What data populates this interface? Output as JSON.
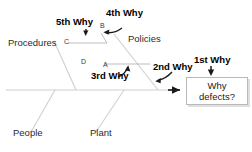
{
  "diagram": {
    "type": "fishbone-ishikawa-5why",
    "spine": {
      "label": "main-spine",
      "arrow": "right-arrowhead"
    },
    "effect": {
      "line1": "Why",
      "line2": "defects?"
    },
    "categories": [
      {
        "id": "procedures",
        "label": "Procedures"
      },
      {
        "id": "policies",
        "label": "Policies"
      },
      {
        "id": "people",
        "label": "People"
      },
      {
        "id": "plant",
        "label": "Plant"
      }
    ],
    "points": [
      {
        "id": "a",
        "label": "A"
      },
      {
        "id": "b",
        "label": "B"
      },
      {
        "id": "c",
        "label": "C"
      },
      {
        "id": "d",
        "label": "D"
      }
    ],
    "why_labels": [
      {
        "id": "why1",
        "label": "1st Why",
        "arrow": "down-straight",
        "targets": "effect-box"
      },
      {
        "id": "why2",
        "label": "2nd Why",
        "arrow": "curve-down-left",
        "targets": "policies-bone"
      },
      {
        "id": "why3",
        "label": "3rd Why",
        "arrow": "curve-up-right",
        "targets": "point-a"
      },
      {
        "id": "why4",
        "label": "4th Why",
        "arrow": "curve-down-left",
        "targets": "point-b"
      },
      {
        "id": "why5",
        "label": "5th Why",
        "arrow": "down-straight",
        "targets": "point-c"
      }
    ],
    "colors": {
      "bone": "#cfcfcf",
      "connector": "#b5b5b5",
      "arrow": "#1a1a1a",
      "text": "#000000",
      "box_border": "#b9b9b9",
      "background": "#ffffff"
    }
  }
}
